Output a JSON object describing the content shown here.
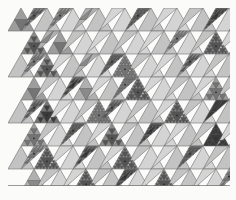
{
  "figure": {
    "kind": "triangular-subdivision-tiling",
    "caption": ""
  },
  "canvas": {
    "width": 236,
    "height": 200,
    "background": "#fbfbfa",
    "margin_left": 8,
    "margin_top": 8,
    "margin_bottom": 14,
    "margin_right": 6
  },
  "grid": {
    "columns": 9,
    "rows": 8,
    "cell_width": 26,
    "cell_height": 23,
    "right_edge": "sawtooth",
    "top_edge": "flat",
    "bottom_edge": "flat",
    "stroke_color": "#6f6f6f",
    "stroke_width": 0.6
  },
  "palette": {
    "background": "#fbfbfa",
    "base_fill": "#b9b9b9",
    "light_fill": "#d2d2d2",
    "lighter_fill": "#dedede",
    "mid_fill": "#a8a8a8",
    "dark_fill": "#8e8e8e",
    "darker_fill": "#6d6d6d",
    "deep_fill": "#4e4e4e",
    "white_fill": "#ffffff",
    "stroke": "#6f6f6f",
    "fine_stroke": "#5a5a5a",
    "vertex_dot": "#2a2a2a"
  },
  "chart_data": {
    "type": "heatmap",
    "xlabel": "",
    "ylabel": "",
    "columns": 9,
    "rows": 8,
    "legend": [],
    "note": "Each cell holds an up-triangle and a down-triangle; value = gray level index, depth = recursive subdivision level.",
    "cells": [
      {
        "r": 0,
        "c": 0,
        "up": {
          "g": 5,
          "d": 1
        },
        "down": {
          "g": 6,
          "d": 2
        }
      },
      {
        "r": 0,
        "c": 1,
        "up": {
          "g": 3,
          "d": 0
        },
        "down": {
          "g": 5,
          "d": 2
        }
      },
      {
        "r": 0,
        "c": 2,
        "up": {
          "g": 2,
          "d": 0
        },
        "down": {
          "g": 4,
          "d": 1
        }
      },
      {
        "r": 0,
        "c": 3,
        "up": {
          "g": 3,
          "d": 0
        },
        "down": {
          "g": 2,
          "d": 0
        }
      },
      {
        "r": 0,
        "c": 4,
        "up": {
          "g": 2,
          "d": 0
        },
        "down": {
          "g": 6,
          "d": 3
        }
      },
      {
        "r": 0,
        "c": 5,
        "up": {
          "g": 3,
          "d": 0
        },
        "down": {
          "g": 2,
          "d": 0
        }
      },
      {
        "r": 0,
        "c": 6,
        "up": {
          "g": 2,
          "d": 0
        },
        "down": {
          "g": 3,
          "d": 0
        }
      },
      {
        "r": 0,
        "c": 7,
        "up": {
          "g": 3,
          "d": 0
        },
        "down": {
          "g": 7,
          "d": 3
        }
      },
      {
        "r": 0,
        "c": 8,
        "up": {
          "g": 2,
          "d": 0
        },
        "down": {
          "g": 8,
          "d": 1
        }
      },
      {
        "r": 1,
        "c": 0,
        "up": {
          "g": 6,
          "d": 2
        },
        "down": {
          "g": 4,
          "d": 1
        }
      },
      {
        "r": 1,
        "c": 1,
        "up": {
          "g": 5,
          "d": 1
        },
        "down": {
          "g": 3,
          "d": 0
        }
      },
      {
        "r": 1,
        "c": 2,
        "up": {
          "g": 2,
          "d": 0
        },
        "down": {
          "g": 2,
          "d": 0
        }
      },
      {
        "r": 1,
        "c": 3,
        "up": {
          "g": 3,
          "d": 0
        },
        "down": {
          "g": 3,
          "d": 0
        }
      },
      {
        "r": 1,
        "c": 4,
        "up": {
          "g": 2,
          "d": 0
        },
        "down": {
          "g": 2,
          "d": 0
        }
      },
      {
        "r": 1,
        "c": 5,
        "up": {
          "g": 3,
          "d": 0
        },
        "down": {
          "g": 5,
          "d": 2
        }
      },
      {
        "r": 1,
        "c": 6,
        "up": {
          "g": 2,
          "d": 0
        },
        "down": {
          "g": 3,
          "d": 0
        }
      },
      {
        "r": 1,
        "c": 7,
        "up": {
          "g": 6,
          "d": 3
        },
        "down": {
          "g": 2,
          "d": 0
        }
      },
      {
        "r": 1,
        "c": 8,
        "up": {
          "g": 8,
          "d": 1
        },
        "down": {
          "g": 3,
          "d": 0
        }
      },
      {
        "r": 2,
        "c": 0,
        "up": {
          "g": 3,
          "d": 0
        },
        "down": {
          "g": 5,
          "d": 2
        }
      },
      {
        "r": 2,
        "c": 1,
        "up": {
          "g": 6,
          "d": 2
        },
        "down": {
          "g": 2,
          "d": 0
        }
      },
      {
        "r": 2,
        "c": 2,
        "up": {
          "g": 3,
          "d": 0
        },
        "down": {
          "g": 4,
          "d": 1
        }
      },
      {
        "r": 2,
        "c": 3,
        "up": {
          "g": 2,
          "d": 0
        },
        "down": {
          "g": 6,
          "d": 3
        }
      },
      {
        "r": 2,
        "c": 4,
        "up": {
          "g": 5,
          "d": 3
        },
        "down": {
          "g": 3,
          "d": 0
        }
      },
      {
        "r": 2,
        "c": 5,
        "up": {
          "g": 2,
          "d": 0
        },
        "down": {
          "g": 2,
          "d": 0
        }
      },
      {
        "r": 2,
        "c": 6,
        "up": {
          "g": 3,
          "d": 0
        },
        "down": {
          "g": 6,
          "d": 2
        }
      },
      {
        "r": 2,
        "c": 7,
        "up": {
          "g": 2,
          "d": 0
        },
        "down": {
          "g": 3,
          "d": 0
        }
      },
      {
        "r": 2,
        "c": 8,
        "up": {
          "g": 3,
          "d": 0
        },
        "down": {
          "g": 2,
          "d": 0
        }
      },
      {
        "r": 3,
        "c": 0,
        "up": {
          "g": 5,
          "d": 1
        },
        "down": {
          "g": 3,
          "d": 0
        }
      },
      {
        "r": 3,
        "c": 1,
        "up": {
          "g": 2,
          "d": 0
        },
        "down": {
          "g": 7,
          "d": 2
        }
      },
      {
        "r": 3,
        "c": 2,
        "up": {
          "g": 4,
          "d": 1
        },
        "down": {
          "g": 2,
          "d": 0
        }
      },
      {
        "r": 3,
        "c": 3,
        "up": {
          "g": 3,
          "d": 0
        },
        "down": {
          "g": 5,
          "d": 3
        }
      },
      {
        "r": 3,
        "c": 4,
        "up": {
          "g": 6,
          "d": 3
        },
        "down": {
          "g": 2,
          "d": 0
        }
      },
      {
        "r": 3,
        "c": 5,
        "up": {
          "g": 2,
          "d": 0
        },
        "down": {
          "g": 3,
          "d": 0
        }
      },
      {
        "r": 3,
        "c": 6,
        "up": {
          "g": 3,
          "d": 0
        },
        "down": {
          "g": 2,
          "d": 0
        }
      },
      {
        "r": 3,
        "c": 7,
        "up": {
          "g": 5,
          "d": 2
        },
        "down": {
          "g": 3,
          "d": 0
        }
      },
      {
        "r": 3,
        "c": 8,
        "up": {
          "g": 2,
          "d": 0
        },
        "down": {
          "g": 4,
          "d": 1
        }
      },
      {
        "r": 4,
        "c": 0,
        "up": {
          "g": 3,
          "d": 0
        },
        "down": {
          "g": 6,
          "d": 2
        }
      },
      {
        "r": 4,
        "c": 1,
        "up": {
          "g": 7,
          "d": 2
        },
        "down": {
          "g": 2,
          "d": 0
        }
      },
      {
        "r": 4,
        "c": 2,
        "up": {
          "g": 2,
          "d": 0
        },
        "down": {
          "g": 3,
          "d": 0
        }
      },
      {
        "r": 4,
        "c": 3,
        "up": {
          "g": 5,
          "d": 3
        },
        "down": {
          "g": 6,
          "d": 2
        }
      },
      {
        "r": 4,
        "c": 4,
        "up": {
          "g": 2,
          "d": 0
        },
        "down": {
          "g": 3,
          "d": 0
        }
      },
      {
        "r": 4,
        "c": 5,
        "up": {
          "g": 3,
          "d": 0
        },
        "down": {
          "g": 2,
          "d": 0
        }
      },
      {
        "r": 4,
        "c": 6,
        "up": {
          "g": 6,
          "d": 3
        },
        "down": {
          "g": 3,
          "d": 0
        }
      },
      {
        "r": 4,
        "c": 7,
        "up": {
          "g": 2,
          "d": 0
        },
        "down": {
          "g": 9,
          "d": 1
        }
      },
      {
        "r": 4,
        "c": 8,
        "up": {
          "g": 3,
          "d": 0
        },
        "down": {
          "g": 2,
          "d": 0
        }
      },
      {
        "r": 5,
        "c": 0,
        "up": {
          "g": 5,
          "d": 2
        },
        "down": {
          "g": 3,
          "d": 0
        }
      },
      {
        "r": 5,
        "c": 1,
        "up": {
          "g": 2,
          "d": 0
        },
        "down": {
          "g": 6,
          "d": 3
        }
      },
      {
        "r": 5,
        "c": 2,
        "up": {
          "g": 3,
          "d": 0
        },
        "down": {
          "g": 2,
          "d": 0
        }
      },
      {
        "r": 5,
        "c": 3,
        "up": {
          "g": 6,
          "d": 2
        },
        "down": {
          "g": 3,
          "d": 0
        }
      },
      {
        "r": 5,
        "c": 4,
        "up": {
          "g": 3,
          "d": 0
        },
        "down": {
          "g": 7,
          "d": 3
        }
      },
      {
        "r": 5,
        "c": 5,
        "up": {
          "g": 2,
          "d": 0
        },
        "down": {
          "g": 2,
          "d": 0
        }
      },
      {
        "r": 5,
        "c": 6,
        "up": {
          "g": 3,
          "d": 0
        },
        "down": {
          "g": 3,
          "d": 0
        }
      },
      {
        "r": 5,
        "c": 7,
        "up": {
          "g": 9,
          "d": 2
        },
        "down": {
          "g": 2,
          "d": 0
        }
      },
      {
        "r": 5,
        "c": 8,
        "up": {
          "g": 2,
          "d": 0
        },
        "down": {
          "g": 3,
          "d": 0
        }
      },
      {
        "r": 6,
        "c": 0,
        "up": {
          "g": 3,
          "d": 0
        },
        "down": {
          "g": 5,
          "d": 2
        }
      },
      {
        "r": 6,
        "c": 1,
        "up": {
          "g": 6,
          "d": 3
        },
        "down": {
          "g": 2,
          "d": 0
        }
      },
      {
        "r": 6,
        "c": 2,
        "up": {
          "g": 2,
          "d": 0
        },
        "down": {
          "g": 7,
          "d": 2
        }
      },
      {
        "r": 6,
        "c": 3,
        "up": {
          "g": 3,
          "d": 0
        },
        "down": {
          "g": 2,
          "d": 0
        }
      },
      {
        "r": 6,
        "c": 4,
        "up": {
          "g": 6,
          "d": 3
        },
        "down": {
          "g": 3,
          "d": 0
        }
      },
      {
        "r": 6,
        "c": 5,
        "up": {
          "g": 2,
          "d": 0
        },
        "down": {
          "g": 2,
          "d": 0
        }
      },
      {
        "r": 6,
        "c": 6,
        "up": {
          "g": 3,
          "d": 0
        },
        "down": {
          "g": 6,
          "d": 3
        }
      },
      {
        "r": 6,
        "c": 7,
        "up": {
          "g": 2,
          "d": 0
        },
        "down": {
          "g": 3,
          "d": 0
        }
      },
      {
        "r": 6,
        "c": 8,
        "up": {
          "g": 3,
          "d": 0
        },
        "down": {
          "g": 2,
          "d": 0
        }
      },
      {
        "r": 7,
        "c": 0,
        "up": {
          "g": 4,
          "d": 1
        },
        "down": {
          "g": 3,
          "d": 0
        }
      },
      {
        "r": 7,
        "c": 1,
        "up": {
          "g": 2,
          "d": 0
        },
        "down": {
          "g": 2,
          "d": 0
        }
      },
      {
        "r": 7,
        "c": 2,
        "up": {
          "g": 6,
          "d": 3
        },
        "down": {
          "g": 3,
          "d": 0
        }
      },
      {
        "r": 7,
        "c": 3,
        "up": {
          "g": 3,
          "d": 0
        },
        "down": {
          "g": 7,
          "d": 3
        }
      },
      {
        "r": 7,
        "c": 4,
        "up": {
          "g": 2,
          "d": 0
        },
        "down": {
          "g": 2,
          "d": 0
        }
      },
      {
        "r": 7,
        "c": 5,
        "up": {
          "g": 6,
          "d": 3
        },
        "down": {
          "g": 3,
          "d": 0
        }
      },
      {
        "r": 7,
        "c": 6,
        "up": {
          "g": 3,
          "d": 0
        },
        "down": {
          "g": 2,
          "d": 0
        }
      },
      {
        "r": 7,
        "c": 7,
        "up": {
          "g": 2,
          "d": 0
        },
        "down": {
          "g": 5,
          "d": 2
        }
      },
      {
        "r": 7,
        "c": 8,
        "up": {
          "g": 3,
          "d": 0
        },
        "down": {
          "g": 3,
          "d": 0
        }
      }
    ],
    "gray_scale": [
      "#ffffff",
      "#ececec",
      "#d4d4d4",
      "#c3c3c3",
      "#b0b0b0",
      "#9d9d9d",
      "#8a8a8a",
      "#747474",
      "#545454",
      "#3a3a3a"
    ]
  }
}
